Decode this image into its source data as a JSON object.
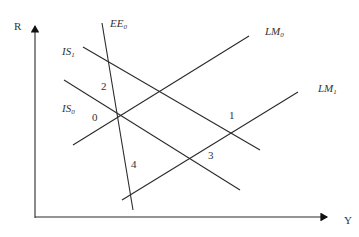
{
  "diagram": {
    "type": "IS-LM-EE economics diagram",
    "axes": {
      "y_label": "R",
      "x_label": "Y"
    },
    "curves": [
      {
        "id": "EE0",
        "name": "EE",
        "sub": "0",
        "x1": 102,
        "y1": 23,
        "x2": 133,
        "y2": 210,
        "lx": 110,
        "ly": 27
      },
      {
        "id": "IS1",
        "name": "IS",
        "sub": "1",
        "x1": 83,
        "y1": 47,
        "x2": 260,
        "y2": 150,
        "lx": 62,
        "ly": 55
      },
      {
        "id": "IS0",
        "name": "IS",
        "sub": "0",
        "x1": 64,
        "y1": 80,
        "x2": 240,
        "y2": 190,
        "lx": 62,
        "ly": 112
      },
      {
        "id": "LM0",
        "name": "LM",
        "sub": "0",
        "x1": 73,
        "y1": 145,
        "x2": 249,
        "y2": 36,
        "lx": 265,
        "ly": 35
      },
      {
        "id": "LM1",
        "name": "LM",
        "sub": "1",
        "x1": 122,
        "y1": 200,
        "x2": 298,
        "y2": 92,
        "lx": 318,
        "ly": 92
      }
    ],
    "points": [
      {
        "label": "2",
        "x": 101,
        "y": 90
      },
      {
        "label": "0",
        "x": 92,
        "y": 121
      },
      {
        "label": "1",
        "x": 229,
        "y": 119
      },
      {
        "label": "3",
        "x": 208,
        "y": 159
      },
      {
        "label": "4",
        "x": 131,
        "y": 168
      }
    ]
  }
}
